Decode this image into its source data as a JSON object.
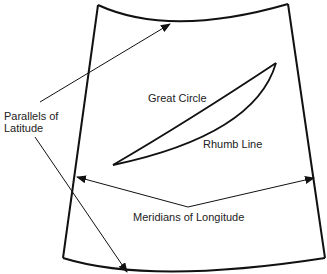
{
  "diagram": {
    "colors": {
      "background": "#ffffff",
      "stroke": "#111111",
      "text": "#222222"
    },
    "labels": {
      "parallels_line1": "Parallels of",
      "parallels_line2": "Latitude",
      "great_circle": "Great Circle",
      "rhumb_line": "Rhumb Line",
      "meridians": "Meridians of Longitude"
    }
  }
}
